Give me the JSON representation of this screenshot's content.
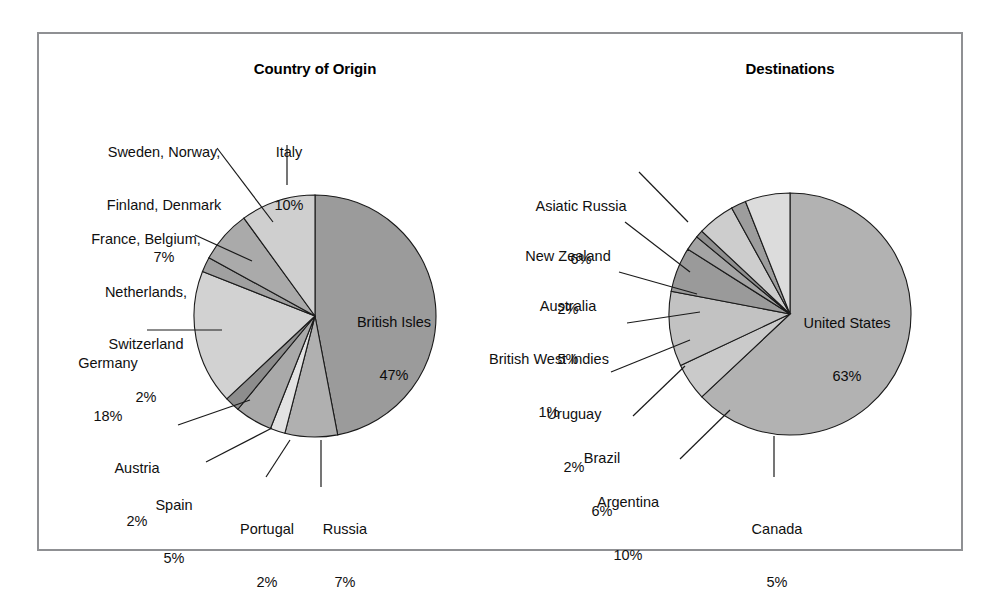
{
  "figure": {
    "background": "#ffffff",
    "frame_color": "#8f9093"
  },
  "chart_data": [
    {
      "type": "pie",
      "title": "Country of Origin",
      "unit": "%",
      "start_angle_deg": 0,
      "direction": "clockwise",
      "categories": [
        "British Isles",
        "Russia",
        "Portugal",
        "Spain",
        "Austria",
        "Germany",
        "France, Belgium, Netherlands, Switzerland",
        "Sweden, Norway, Finland, Denmark",
        "Italy"
      ],
      "values": [
        47,
        7,
        2,
        5,
        2,
        18,
        2,
        7,
        10
      ],
      "labels": [
        "British Isles\n47%",
        "Russia\n7%",
        "Portugal\n2%",
        "Spain\n5%",
        "Austria\n2%",
        "Germany\n18%",
        "France, Belgium,\nNetherlands,\nSwitzerland\n2%",
        "Sweden, Norway,\nFinland, Denmark\n7%",
        "Italy\n10%"
      ],
      "colors": [
        "#9b9b9b",
        "#b0b0b0",
        "#e2e2e2",
        "#a9a9a9",
        "#8d8d8d",
        "#d2d2d2",
        "#a0a0a0",
        "#aaaaaa",
        "#cfcfcf"
      ],
      "legend": "none",
      "grid": false
    },
    {
      "type": "pie",
      "title": "Destinations",
      "unit": "%",
      "start_angle_deg": 0,
      "direction": "clockwise",
      "categories": [
        "United States",
        "Canada",
        "Argentina",
        "Brazil",
        "Uruguay",
        "British West Indies",
        "Australia",
        "New Zealand",
        "Asiatic Russia"
      ],
      "values": [
        63,
        5,
        10,
        6,
        2,
        1,
        5,
        2,
        6
      ],
      "labels": [
        "United States\n63%",
        "Canada\n5%",
        "Argentina\n10%",
        "Brazil\n6%",
        "Uruguay\n2%",
        "British West Indies\n1%",
        "Australia\n5%",
        "New Zealand\n2%",
        "Asiatic Russia\n6%"
      ],
      "colors": [
        "#b2b2b2",
        "#cacaca",
        "#c2c2c2",
        "#9a9a9a",
        "#a4a4a4",
        "#8f8f8f",
        "#cdcdcd",
        "#9d9d9d",
        "#dcdcdc"
      ],
      "legend": "none",
      "grid": false
    }
  ],
  "left_chart": {
    "title": "Country of Origin",
    "inner_labels": [
      {
        "name": "british-isles",
        "line1": "British Isles",
        "line2": "47%"
      }
    ],
    "callouts": [
      {
        "name": "sweden-norway-finland-denmark",
        "lines": [
          "Sweden, Norway,",
          "Finland, Denmark",
          "7%"
        ]
      },
      {
        "name": "france-belgium-netherlands-switzerland",
        "lines": [
          "France, Belgium,",
          "Netherlands,",
          "Switzerland",
          "2%"
        ]
      },
      {
        "name": "germany",
        "lines": [
          "Germany",
          "18%"
        ]
      },
      {
        "name": "austria",
        "lines": [
          "Austria",
          "2%"
        ]
      },
      {
        "name": "spain",
        "lines": [
          "Spain",
          "5%"
        ]
      },
      {
        "name": "portugal",
        "lines": [
          "Portugal",
          "2%"
        ]
      },
      {
        "name": "russia",
        "lines": [
          "Russia",
          "7%"
        ]
      },
      {
        "name": "italy",
        "lines": [
          "Italy",
          "10%"
        ]
      }
    ]
  },
  "right_chart": {
    "title": "Destinations",
    "inner_labels": [
      {
        "name": "united-states",
        "line1": "United States",
        "line2": "63%"
      }
    ],
    "callouts": [
      {
        "name": "asiatic-russia",
        "lines": [
          "Asiatic Russia",
          "6%"
        ]
      },
      {
        "name": "new-zealand",
        "lines": [
          "New Zealand",
          "2%"
        ]
      },
      {
        "name": "australia",
        "lines": [
          "Australia",
          "5%"
        ]
      },
      {
        "name": "british-west-indies",
        "lines": [
          "British West Indies",
          "1%"
        ]
      },
      {
        "name": "uruguay",
        "lines": [
          "Uruguay",
          "2%"
        ]
      },
      {
        "name": "brazil",
        "lines": [
          "Brazil",
          "6%"
        ]
      },
      {
        "name": "argentina",
        "lines": [
          "Argentina",
          "10%"
        ]
      },
      {
        "name": "canada",
        "lines": [
          "Canada",
          "5%"
        ]
      }
    ]
  },
  "text": {
    "left_title": "Country of Origin",
    "right_title": "Destinations",
    "left_center_l1": "British Isles",
    "left_center_l2": "47%",
    "right_center_l1": "United States",
    "right_center_l2": "63%",
    "l_sweden_1": "Sweden, Norway,",
    "l_sweden_2": "Finland, Denmark",
    "l_sweden_3": "7%",
    "l_france_1": "France, Belgium,",
    "l_france_2": "Netherlands,",
    "l_france_3": "Switzerland",
    "l_france_4": "2%",
    "l_germany_1": "Germany",
    "l_germany_2": "18%",
    "l_austria_1": "Austria",
    "l_austria_2": "2%",
    "l_spain_1": "Spain",
    "l_spain_2": "5%",
    "l_portugal_1": "Portugal",
    "l_portugal_2": "2%",
    "l_russia_1": "Russia",
    "l_russia_2": "7%",
    "l_italy_1": "Italy",
    "l_italy_2": "10%",
    "r_asiatic_1": "Asiatic Russia",
    "r_asiatic_2": "6%",
    "r_nz_1": "New Zealand",
    "r_nz_2": "2%",
    "r_australia_1": "Australia",
    "r_australia_2": "5%",
    "r_bwi_1": "British West Indies",
    "r_bwi_2": "1%",
    "r_uruguay_1": "Uruguay",
    "r_uruguay_2": "2%",
    "r_brazil_1": "Brazil",
    "r_brazil_2": "6%",
    "r_argentina_1": "Argentina",
    "r_argentina_2": "10%",
    "r_canada_1": "Canada",
    "r_canada_2": "5%"
  }
}
